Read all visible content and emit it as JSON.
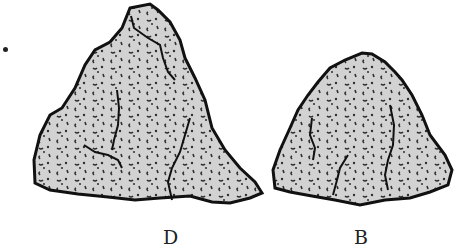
{
  "figure": {
    "partial_label": ".",
    "rocks": [
      {
        "label": "D",
        "fill": "#d2d2d2",
        "stroke": "#111111"
      },
      {
        "label": "B",
        "fill": "#d2d2d2",
        "stroke": "#111111"
      }
    ]
  }
}
